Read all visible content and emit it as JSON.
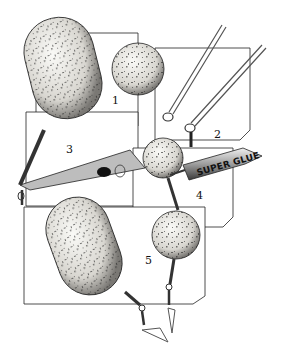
{
  "diagram": {
    "panels": [
      {
        "label": "1",
        "x": 112,
        "y": 104
      },
      {
        "label": "2",
        "x": 214,
        "y": 138
      },
      {
        "label": "3",
        "x": 66,
        "y": 153
      },
      {
        "label": "4",
        "x": 196,
        "y": 199
      },
      {
        "label": "5",
        "x": 145,
        "y": 264
      }
    ],
    "tube_label": "SUPER GLUE",
    "colors": {
      "ink": "#111111",
      "paper": "#ffffff",
      "bait": "#e8e6e0",
      "metal": "#9a9a9a"
    }
  }
}
